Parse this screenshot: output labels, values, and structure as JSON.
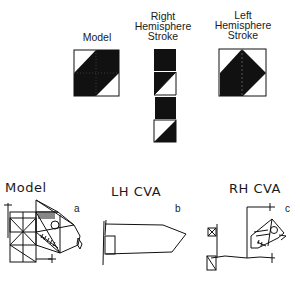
{
  "top_panel": {
    "model_label": "Model",
    "rh_label_lines": [
      "Right",
      "Hemisphere",
      "Stroke"
    ],
    "lh_label_lines": [
      "Left",
      "Hemisphere",
      "Stroke"
    ]
  },
  "bottom_panel": {
    "model_label": "Model",
    "lh_label": "LH CVA",
    "rh_label": "RH CVA",
    "panel_letters": [
      "a",
      "b",
      "c"
    ]
  }
}
